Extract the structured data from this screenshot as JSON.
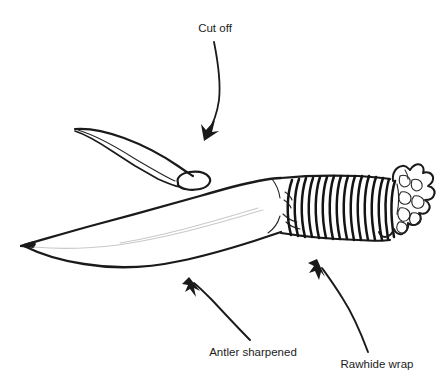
{
  "figure": {
    "background_color": "#ffffff",
    "ink_color": "#1a1a1a",
    "bevel_color": "#c9c9c9",
    "width": 442,
    "height": 381
  },
  "labels": [
    {
      "id": "cut-off",
      "text": "Cut off",
      "x": 215,
      "y": 32,
      "anchor": "middle",
      "points_to": "antler-tip-cut-face"
    },
    {
      "id": "antler-sharpened",
      "text": "Antler sharpened",
      "x": 253,
      "y": 356,
      "anchor": "middle",
      "points_to": "blade"
    },
    {
      "id": "rawhide-wrap",
      "text": "Rawhide wrap",
      "x": 377,
      "y": 368,
      "anchor": "middle",
      "points_to": "handle-wrap"
    }
  ],
  "parts": [
    {
      "id": "antler-tip",
      "name": "Cut off antler tip",
      "description": "Tapered curved antler tip severed from the main beam, elliptical cut face at lower right"
    },
    {
      "id": "blade",
      "name": "Sharpened antler blade",
      "description": "Long curved blade tapering to a sharp point at the left with a faint interior bevel line"
    },
    {
      "id": "handle-wrap",
      "name": "Rawhide wrap",
      "description": "Series of coiled rawhide bands binding the handle",
      "coil_count": 16
    },
    {
      "id": "antler-burr",
      "name": "Antler burr crown",
      "description": "Gnarled lumpy antler base forming the butt of the handle"
    }
  ],
  "arrows": [
    {
      "id": "arrow-cut-off",
      "from_label": "cut-off",
      "direction": "down-left",
      "style": "curved"
    },
    {
      "id": "arrow-antler-sharpened",
      "from_label": "antler-sharpened",
      "direction": "up-left",
      "style": "slightly-curved"
    },
    {
      "id": "arrow-rawhide-wrap",
      "from_label": "rawhide-wrap",
      "direction": "up-left",
      "style": "curved"
    }
  ]
}
